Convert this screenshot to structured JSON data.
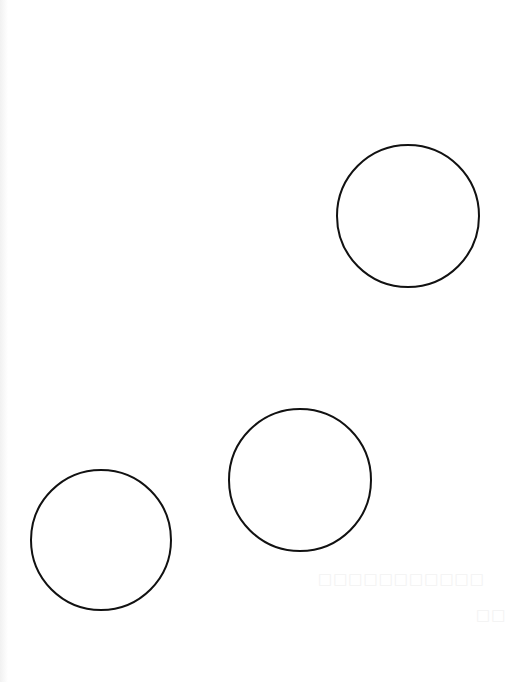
{
  "diagram": {
    "background": "#ffffff",
    "stroke_color": "#111111",
    "stroke_width": 2,
    "circles": [
      {
        "id": "circle-1",
        "cx": 408,
        "cy": 216,
        "r": 71
      },
      {
        "id": "circle-2",
        "cx": 300,
        "cy": 480,
        "r": 71
      },
      {
        "id": "circle-3",
        "cx": 101,
        "cy": 540,
        "r": 70
      }
    ]
  },
  "watermark": {
    "line1": "□□□□□□□□□□□",
    "line2": "□□"
  }
}
